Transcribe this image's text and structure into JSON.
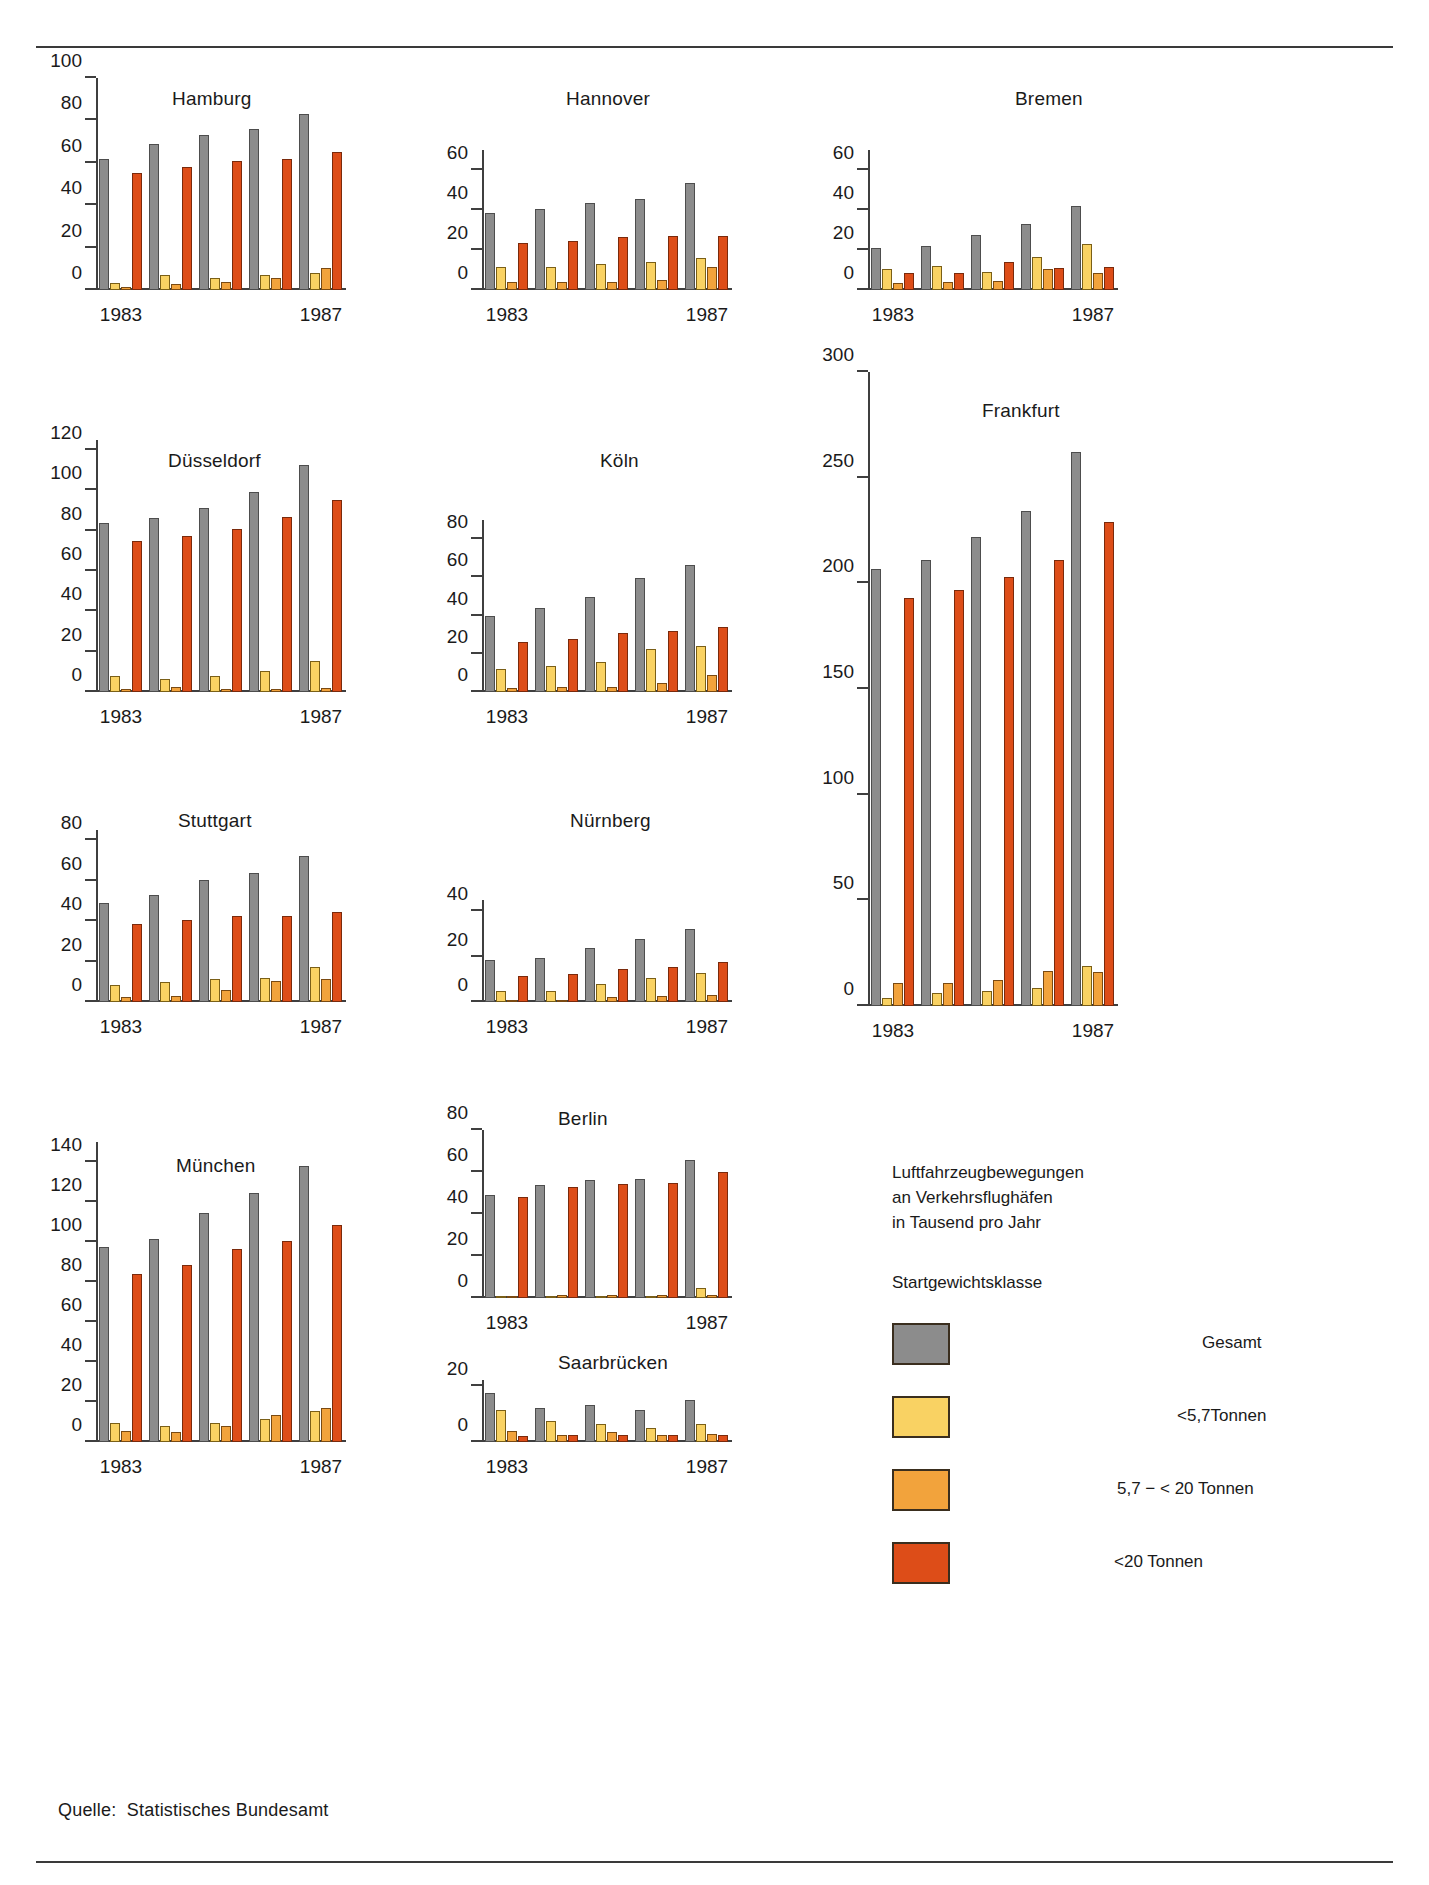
{
  "figure": {
    "source_note": "Quelle:  Statistisches Bundesamt",
    "caption_line1": "Luftfahrzeugbewegungen",
    "caption_line2": "an Verkehrsflughäfen",
    "caption_line3": "in Tausend pro Jahr",
    "legend_heading": "Startgewichtsklasse"
  },
  "legend": {
    "items": [
      {
        "label": "Gesamt",
        "color": "#8c8c8c",
        "key": "total"
      },
      {
        "label": "<5,7Tonnen",
        "color": "#f9d263",
        "key": "small"
      },
      {
        "label": "5,7 − < 20 Tonnen",
        "color": "#f2a33c",
        "key": "mid"
      },
      {
        "label": "<20 Tonnen",
        "color": "#dd4d18",
        "key": "large"
      }
    ]
  },
  "chart_data": [
    {
      "type": "bar",
      "title": "Hamburg",
      "xlabel": "",
      "ylabel": "",
      "ylim": [
        0,
        100
      ],
      "yticks": [
        0,
        20,
        40,
        60,
        80,
        100
      ],
      "categories": [
        "1983",
        "1984",
        "1985",
        "1986",
        "1987"
      ],
      "xtick_labels": [
        "1983",
        "1987"
      ],
      "series": [
        {
          "name": "Gesamt",
          "values": [
            62,
            69,
            73,
            76,
            83
          ]
        },
        {
          "name": "<5,7Tonnen",
          "values": [
            3.5,
            7,
            5.5,
            7,
            8
          ]
        },
        {
          "name": "5,7 − < 20 Tonnen",
          "values": [
            1.5,
            3,
            4,
            5.5,
            10.5
          ]
        },
        {
          "name": "<20 Tonnen",
          "values": [
            55,
            58,
            61,
            62,
            65
          ]
        }
      ]
    },
    {
      "type": "bar",
      "title": "Hannover",
      "xlabel": "",
      "ylabel": "",
      "ylim": [
        0,
        70
      ],
      "yticks": [
        0,
        20,
        40,
        60
      ],
      "categories": [
        "1983",
        "1984",
        "1985",
        "1986",
        "1987"
      ],
      "xtick_labels": [
        "1983",
        "1987"
      ],
      "series": [
        {
          "name": "Gesamt",
          "values": [
            38.5,
            40.5,
            43.5,
            45.5,
            53.5
          ]
        },
        {
          "name": "<5,7Tonnen",
          "values": [
            11.5,
            11.5,
            13,
            14,
            16
          ]
        },
        {
          "name": "5,7 − < 20 Tonnen",
          "values": [
            4,
            4,
            4,
            5,
            11.5
          ]
        },
        {
          "name": "<20 Tonnen",
          "values": [
            23.5,
            24.5,
            26.5,
            27,
            27
          ]
        }
      ]
    },
    {
      "type": "bar",
      "title": "Bremen",
      "xlabel": "",
      "ylabel": "",
      "ylim": [
        0,
        70
      ],
      "yticks": [
        0,
        20,
        40,
        60
      ],
      "categories": [
        "1983",
        "1984",
        "1985",
        "1986",
        "1987"
      ],
      "xtick_labels": [
        "1983",
        "1987"
      ],
      "series": [
        {
          "name": "Gesamt",
          "values": [
            21,
            22,
            27.5,
            33,
            42
          ]
        },
        {
          "name": "<5,7Tonnen",
          "values": [
            10.5,
            12,
            9,
            16.5,
            23
          ]
        },
        {
          "name": "5,7 − < 20 Tonnen",
          "values": [
            3.5,
            4,
            4.5,
            10.5,
            8.5
          ]
        },
        {
          "name": "<20 Tonnen",
          "values": [
            8.5,
            8.5,
            14,
            11,
            11.5
          ]
        }
      ]
    },
    {
      "type": "bar",
      "title": "Düsseldorf",
      "xlabel": "",
      "ylabel": "",
      "ylim": [
        0,
        125
      ],
      "yticks": [
        0,
        20,
        40,
        60,
        80,
        100,
        120
      ],
      "categories": [
        "1983",
        "1984",
        "1985",
        "1986",
        "1987"
      ],
      "xtick_labels": [
        "1983",
        "1987"
      ],
      "series": [
        {
          "name": "Gesamt",
          "values": [
            84,
            86.5,
            91.5,
            99,
            112.5
          ]
        },
        {
          "name": "<5,7Tonnen",
          "values": [
            8,
            6.5,
            8,
            10.5,
            15.5
          ]
        },
        {
          "name": "5,7 − < 20 Tonnen",
          "values": [
            1.5,
            2.5,
            1.5,
            1.5,
            2
          ]
        },
        {
          "name": "<20 Tonnen",
          "values": [
            75,
            77.5,
            81,
            87,
            95
          ]
        }
      ]
    },
    {
      "type": "bar",
      "title": "Köln",
      "xlabel": "",
      "ylabel": "",
      "ylim": [
        0,
        90
      ],
      "yticks": [
        0,
        20,
        40,
        60,
        80
      ],
      "categories": [
        "1983",
        "1984",
        "1985",
        "1986",
        "1987"
      ],
      "xtick_labels": [
        "1983",
        "1987"
      ],
      "series": [
        {
          "name": "Gesamt",
          "values": [
            40,
            44,
            49.5,
            59.5,
            66.5
          ]
        },
        {
          "name": "<5,7Tonnen",
          "values": [
            12,
            13.5,
            15.5,
            22.5,
            24
          ]
        },
        {
          "name": "5,7 − < 20 Tonnen",
          "values": [
            2,
            2.5,
            2.5,
            4.5,
            9
          ]
        },
        {
          "name": "<20 Tonnen",
          "values": [
            26,
            28,
            31,
            32,
            34
          ]
        }
      ]
    },
    {
      "type": "bar",
      "title": "Frankfurt",
      "xlabel": "",
      "ylabel": "",
      "ylim": [
        0,
        300
      ],
      "yticks": [
        0,
        50,
        100,
        150,
        200,
        250,
        300
      ],
      "categories": [
        "1983",
        "1984",
        "1985",
        "1986",
        "1987"
      ],
      "xtick_labels": [
        "1983",
        "1987"
      ],
      "series": [
        {
          "name": "Gesamt",
          "values": [
            207,
            211,
            222,
            234,
            262
          ]
        },
        {
          "name": "<5,7Tonnen",
          "values": [
            4,
            6,
            7,
            8.5,
            19
          ]
        },
        {
          "name": "5,7 − < 20 Tonnen",
          "values": [
            11,
            11,
            12.5,
            16.5,
            16
          ]
        },
        {
          "name": "<20 Tonnen",
          "values": [
            193,
            197,
            203,
            211,
            229
          ]
        }
      ]
    },
    {
      "type": "bar",
      "title": "Stuttgart",
      "xlabel": "",
      "ylabel": "",
      "ylim": [
        0,
        85
      ],
      "yticks": [
        0,
        20,
        40,
        60,
        80
      ],
      "categories": [
        "1983",
        "1984",
        "1985",
        "1986",
        "1987"
      ],
      "xtick_labels": [
        "1983",
        "1987"
      ],
      "series": [
        {
          "name": "Gesamt",
          "values": [
            49,
            53,
            60.5,
            64,
            72
          ]
        },
        {
          "name": "<5,7Tonnen",
          "values": [
            8.5,
            10,
            11.5,
            12,
            17.5
          ]
        },
        {
          "name": "5,7 − < 20 Tonnen",
          "values": [
            2.5,
            3,
            6,
            10.5,
            11.5
          ]
        },
        {
          "name": "<20 Tonnen",
          "values": [
            38.5,
            40.5,
            42.5,
            42.5,
            44.5
          ]
        }
      ]
    },
    {
      "type": "bar",
      "title": "Nürnberg",
      "xlabel": "",
      "ylabel": "",
      "ylim": [
        0,
        45
      ],
      "yticks": [
        0,
        20,
        40
      ],
      "categories": [
        "1983",
        "1984",
        "1985",
        "1986",
        "1987"
      ],
      "xtick_labels": [
        "1983",
        "1987"
      ],
      "series": [
        {
          "name": "Gesamt",
          "values": [
            18.5,
            19.5,
            24,
            28,
            32
          ]
        },
        {
          "name": "<5,7Tonnen",
          "values": [
            5,
            5,
            8,
            10.5,
            13
          ]
        },
        {
          "name": "5,7 − < 20 Tonnen",
          "values": [
            1,
            1,
            2,
            2.5,
            3
          ]
        },
        {
          "name": "<20 Tonnen",
          "values": [
            11.5,
            12.5,
            14.5,
            15.5,
            17.5
          ]
        }
      ]
    },
    {
      "type": "bar",
      "title": "München",
      "xlabel": "",
      "ylabel": "",
      "ylim": [
        0,
        150
      ],
      "yticks": [
        0,
        20,
        40,
        60,
        80,
        100,
        120,
        140
      ],
      "categories": [
        "1983",
        "1984",
        "1985",
        "1986",
        "1987"
      ],
      "xtick_labels": [
        "1983",
        "1987"
      ],
      "series": [
        {
          "name": "Gesamt",
          "values": [
            97.5,
            101.5,
            114.5,
            124.5,
            138
          ]
        },
        {
          "name": "<5,7Tonnen",
          "values": [
            9.5,
            8,
            9.5,
            11.5,
            15.5
          ]
        },
        {
          "name": "5,7 − < 20 Tonnen",
          "values": [
            5.5,
            5,
            8,
            13.5,
            17
          ]
        },
        {
          "name": "<20 Tonnen",
          "values": [
            84,
            88.5,
            96.5,
            100.5,
            108.5
          ]
        }
      ]
    },
    {
      "type": "bar",
      "title": "Berlin",
      "xlabel": "",
      "ylabel": "",
      "ylim": [
        0,
        80
      ],
      "yticks": [
        0,
        20,
        40,
        60,
        80
      ],
      "categories": [
        "1983",
        "1984",
        "1985",
        "1986",
        "1987"
      ],
      "xtick_labels": [
        "1983",
        "1987"
      ],
      "series": [
        {
          "name": "Gesamt",
          "values": [
            49,
            54,
            56,
            56.5,
            65.5
          ]
        },
        {
          "name": "<5,7Tonnen",
          "values": [
            0.6,
            0.6,
            0.6,
            0.6,
            5
          ]
        },
        {
          "name": "5,7 − < 20 Tonnen",
          "values": [
            1,
            1.2,
            1.2,
            1.2,
            1.2
          ]
        },
        {
          "name": "<20 Tonnen",
          "values": [
            48,
            53,
            54.5,
            55,
            60
          ]
        }
      ]
    },
    {
      "type": "bar",
      "title": "Saarbrücken",
      "xlabel": "",
      "ylabel": "",
      "ylim": [
        0,
        22
      ],
      "yticks": [
        0,
        20
      ],
      "categories": [
        "1983",
        "1984",
        "1985",
        "1986",
        "1987"
      ],
      "xtick_labels": [
        "1983",
        "1987"
      ],
      "series": [
        {
          "name": "Gesamt",
          "values": [
            17.5,
            12,
            13,
            11.5,
            15
          ]
        },
        {
          "name": "<5,7Tonnen",
          "values": [
            11.5,
            7.5,
            6.5,
            5,
            6.5
          ]
        },
        {
          "name": "5,7 − < 20 Tonnen",
          "values": [
            4,
            2.5,
            3.5,
            2.5,
            3
          ]
        },
        {
          "name": "<20 Tonnen",
          "values": [
            2,
            2.5,
            2.5,
            2.5,
            2.5
          ]
        }
      ]
    }
  ],
  "layout": {
    "panels": [
      {
        "key": "Hamburg",
        "x": 96,
        "y": 78,
        "w": 250,
        "h": 212,
        "title_x": 172,
        "title_y": 88
      },
      {
        "key": "Hannover",
        "x": 482,
        "y": 150,
        "w": 250,
        "h": 140,
        "title_x": 566,
        "title_y": 88
      },
      {
        "key": "Bremen",
        "x": 868,
        "y": 150,
        "w": 250,
        "h": 140,
        "title_x": 1015,
        "title_y": 88
      },
      {
        "key": "Düsseldorf",
        "x": 96,
        "y": 440,
        "w": 250,
        "h": 252,
        "title_x": 168,
        "title_y": 450
      },
      {
        "key": "Köln",
        "x": 482,
        "y": 520,
        "w": 250,
        "h": 172,
        "title_x": 600,
        "title_y": 450
      },
      {
        "key": "Frankfurt",
        "x": 868,
        "y": 372,
        "w": 250,
        "h": 634,
        "title_x": 982,
        "title_y": 400
      },
      {
        "key": "Stuttgart",
        "x": 96,
        "y": 830,
        "w": 250,
        "h": 172,
        "title_x": 178,
        "title_y": 810
      },
      {
        "key": "Nürnberg",
        "x": 482,
        "y": 900,
        "w": 250,
        "h": 102,
        "title_x": 570,
        "title_y": 810
      },
      {
        "key": "München",
        "x": 96,
        "y": 1142,
        "w": 250,
        "h": 300,
        "title_x": 176,
        "title_y": 1155
      },
      {
        "key": "Berlin",
        "x": 482,
        "y": 1130,
        "w": 250,
        "h": 168,
        "title_x": 558,
        "title_y": 1108
      },
      {
        "key": "Saarbrücken",
        "x": 482,
        "y": 1380,
        "w": 250,
        "h": 62,
        "title_x": 558,
        "title_y": 1352
      }
    ],
    "legend_x": 892,
    "legend_y": 1160,
    "source_x": 58,
    "source_y": 1800
  }
}
